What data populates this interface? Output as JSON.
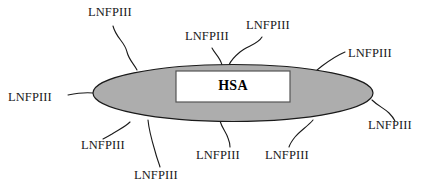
{
  "figure": {
    "type": "schematic-diagram",
    "background_color": "#ffffff"
  },
  "carrier": {
    "shape": "ellipse",
    "label": "HSA",
    "fill_color": "#adadad",
    "stroke_color": "#1a1a1a",
    "center_x": 233,
    "center_y": 93,
    "radius_x": 140,
    "radius_y": 28.5
  },
  "core_box": {
    "label": "HSA",
    "fill_color": "#ffffff",
    "stroke_color": "#555555",
    "x": 176,
    "y": 71,
    "width": 114,
    "height": 31
  },
  "conjugates": [
    {
      "id": "lnfpiii-left",
      "label": "LNFPIII",
      "label_x": 8,
      "label_y": 91,
      "tentacle": "M 68,95 C 78,93 84,92 93,93"
    },
    {
      "id": "lnfpiii-top-left",
      "label": "LNFPIII",
      "label_x": 88,
      "label_y": 6,
      "tentacle": "M 113,26 C 116,38 125,42 127,52 C 129,60 134,64 137,70"
    },
    {
      "id": "lnfpiii-top-center-left",
      "label": "LNFPIII",
      "label_x": 185,
      "label_y": 30,
      "tentacle": "M 212,48 C 215,54 220,57 222,65"
    },
    {
      "id": "lnfpiii-top-center-right",
      "label": "LNFPIII",
      "label_x": 246,
      "label_y": 19,
      "tentacle": "M 262,37 C 258,44 248,46 240,52 C 234,57 231,60 229,65"
    },
    {
      "id": "lnfpiii-top-right",
      "label": "LNFPIII",
      "label_x": 348,
      "label_y": 47,
      "tentacle": "M 345,52 C 338,55 330,60 322,66 C 318,69 316,71 314,73"
    },
    {
      "id": "lnfpiii-right",
      "label": "LNFPIII",
      "label_x": 368,
      "label_y": 119,
      "tentacle": "M 372,100 C 378,106 384,108 389,113 C 393,117 394,119 395,121"
    },
    {
      "id": "lnfpiii-bottom-right",
      "label": "LNFPIII",
      "label_x": 265,
      "label_y": 149,
      "tentacle": "M 313,120 C 308,126 300,131 295,137 C 291,142 290,144 289,147"
    },
    {
      "id": "lnfpiii-bottom-center",
      "label": "LNFPIII",
      "label_x": 196,
      "label_y": 149,
      "tentacle": "M 220,121 C 222,128 226,132 228,138 C 230,143 230,145 230,147"
    },
    {
      "id": "lnfpiii-bottom-low",
      "label": "LNFPIII",
      "label_x": 134,
      "label_y": 169,
      "tentacle": "M 148,120 C 149,131 152,141 155,151 C 157,159 159,163 160,167"
    },
    {
      "id": "lnfpiii-bottom-left",
      "label": "LNFPIII",
      "label_x": 81,
      "label_y": 139,
      "tentacle": "M 130,122 C 125,127 118,130 112,134 C 107,137 105,138 103,139"
    }
  ],
  "style": {
    "tentacle_stroke": "#1a1a1a",
    "tentacle_width": 1.1,
    "label_color": "#1a1a1a"
  }
}
